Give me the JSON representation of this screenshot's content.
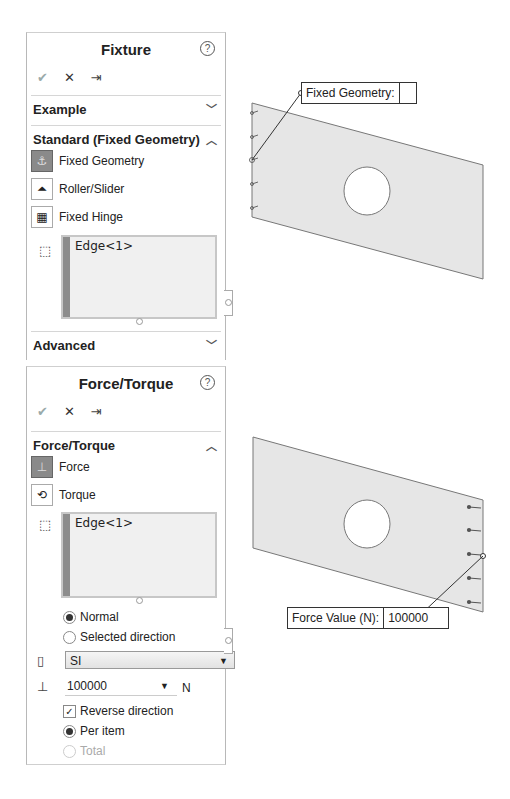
{
  "fixture_panel": {
    "title": "Fixture",
    "help_icon": "?",
    "actions": {
      "ok": "✔",
      "cancel": "✕",
      "pin": "⇥"
    },
    "sections": {
      "example": {
        "label": "Example",
        "state": "collapsed"
      },
      "standard": {
        "label": "Standard (Fixed Geometry)",
        "state": "expanded",
        "options": [
          {
            "label": "Fixed Geometry",
            "icon": "fixed-geometry-icon",
            "selected": true
          },
          {
            "label": "Roller/Slider",
            "icon": "roller-slider-icon",
            "selected": false
          },
          {
            "label": "Fixed Hinge",
            "icon": "fixed-hinge-icon",
            "selected": false
          }
        ],
        "selection": {
          "items": [
            "Edge<1>"
          ]
        }
      },
      "advanced": {
        "label": "Advanced",
        "state": "collapsed"
      }
    }
  },
  "force_panel": {
    "title": "Force/Torque",
    "help_icon": "?",
    "actions": {
      "ok": "✔",
      "cancel": "✕",
      "pin": "⇥"
    },
    "section": {
      "label": "Force/Torque",
      "state": "expanded",
      "options": [
        {
          "label": "Force",
          "icon": "force-icon",
          "selected": true
        },
        {
          "label": "Torque",
          "icon": "torque-icon",
          "selected": false
        }
      ],
      "selection": {
        "items": [
          "Edge<1>"
        ]
      },
      "direction": [
        {
          "label": "Normal",
          "checked": true
        },
        {
          "label": "Selected direction",
          "checked": false
        }
      ],
      "units": {
        "value": "SI"
      },
      "force_value": {
        "value": "100000",
        "unit": "N"
      },
      "reverse_direction": {
        "label": "Reverse direction",
        "checked": true
      },
      "distribution": [
        {
          "label": "Per item",
          "checked": true,
          "enabled": true
        },
        {
          "label": "Total",
          "checked": false,
          "enabled": false
        }
      ]
    }
  },
  "viewport": {
    "top_callout": {
      "label": "Fixed Geometry:",
      "value": ""
    },
    "bottom_callout": {
      "label": "Force Value (N):",
      "value": "100000"
    }
  }
}
